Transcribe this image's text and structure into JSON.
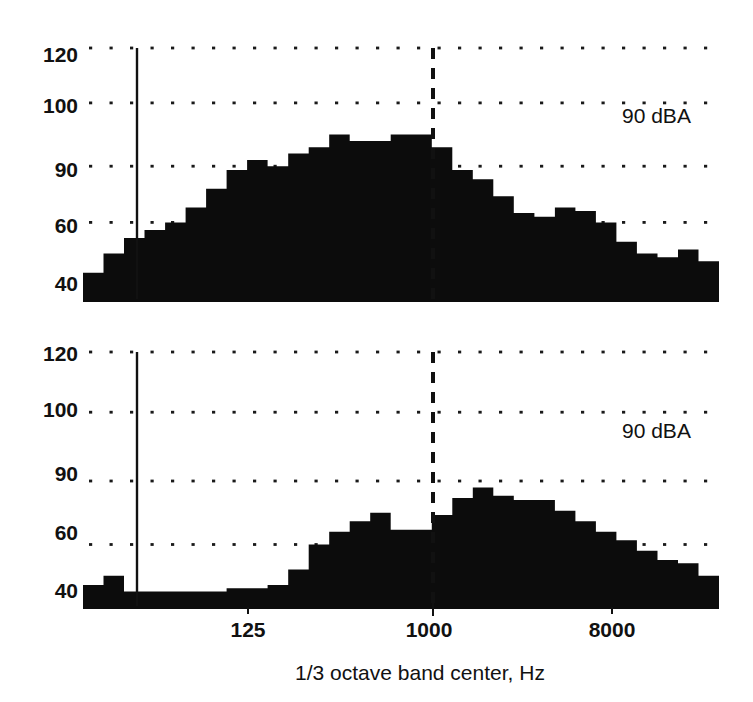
{
  "figure": {
    "background_color": "#ffffff",
    "ink_color": "#0c0c0c",
    "xlabel": "1/3 octave band center, Hz",
    "panel_count": 2
  },
  "chart_data": [
    {
      "type": "bar",
      "panel": "top",
      "title": "",
      "xlabel": "1/3 octave band center, Hz",
      "ylabel": "",
      "annotation": "90 dBA",
      "grid": true,
      "legend": null,
      "ytick_labels": [
        "120",
        "100",
        "90",
        "60",
        "40"
      ],
      "ytick_values": [
        120,
        100,
        90,
        60,
        40
      ],
      "ytick_pixel_fracs": [
        0.0,
        0.218,
        0.469,
        0.692,
        1.0
      ],
      "ylim": [
        40,
        120
      ],
      "xtick_labels": [
        "125",
        "1000",
        "8000"
      ],
      "xtick_values": [
        125,
        1000,
        8000
      ],
      "categories": [
        40,
        50,
        63,
        80,
        100,
        125,
        160,
        200,
        250,
        315,
        400,
        500,
        630,
        800,
        1000,
        1250,
        1600,
        2000,
        2500,
        3150,
        4000,
        5000,
        6300,
        8000,
        10000,
        12500,
        16000,
        20000
      ],
      "values": [
        47,
        52,
        56,
        58,
        60,
        68,
        78,
        88,
        91,
        90,
        92,
        93,
        95,
        94,
        94,
        95,
        95,
        93,
        88,
        83,
        74,
        65,
        63,
        68,
        66,
        60,
        55,
        52,
        51,
        53,
        50
      ],
      "markers": [
        {
          "kind": "solid-vline",
          "at_hz": 80,
          "label": ""
        },
        {
          "kind": "dashed-vline",
          "at_hz": 1000,
          "label": ""
        }
      ]
    },
    {
      "type": "bar",
      "panel": "bottom",
      "title": "",
      "xlabel": "1/3 octave band center, Hz",
      "ylabel": "",
      "annotation": "90 dBA",
      "grid": true,
      "legend": null,
      "ytick_labels": [
        "120",
        "100",
        "90",
        "60",
        "40"
      ],
      "ytick_values": [
        120,
        100,
        90,
        60,
        40
      ],
      "ytick_pixel_fracs": [
        0.0,
        0.236,
        0.506,
        0.755,
        1.0
      ],
      "ylim": [
        40,
        120
      ],
      "xtick_labels": [
        "125",
        "1000",
        "8000"
      ],
      "xtick_values": [
        125,
        1000,
        8000
      ],
      "categories": [
        40,
        50,
        63,
        80,
        100,
        125,
        160,
        200,
        250,
        315,
        400,
        500,
        630,
        800,
        1000,
        1250,
        1600,
        2000,
        2500,
        3150,
        4000,
        5000,
        6300,
        8000,
        10000,
        12500,
        16000,
        20000
      ],
      "values": [
        47,
        50,
        45,
        45,
        45,
        45,
        45,
        46,
        46,
        47,
        52,
        60,
        66,
        71,
        75,
        67,
        67,
        74,
        82,
        87,
        83,
        81,
        81,
        76,
        71,
        66,
        62,
        58,
        55,
        54,
        50
      ],
      "markers": [
        {
          "kind": "solid-vline",
          "at_hz": 80,
          "label": ""
        },
        {
          "kind": "dashed-vline",
          "at_hz": 1000,
          "label": ""
        }
      ]
    }
  ]
}
